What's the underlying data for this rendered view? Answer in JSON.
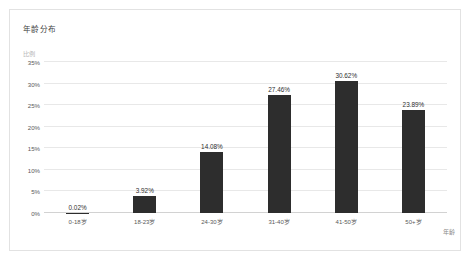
{
  "card": {
    "title": "年龄分布",
    "y_axis_title": "比例",
    "x_axis_title": "年龄"
  },
  "chart_data": {
    "type": "bar",
    "title": "年龄分布",
    "xlabel": "年龄",
    "ylabel": "比例",
    "categories": [
      "0-18岁",
      "18-23岁",
      "24-30岁",
      "31-40岁",
      "41-50岁",
      "50+岁"
    ],
    "values": [
      0.02,
      3.92,
      14.08,
      27.46,
      30.62,
      23.89
    ],
    "value_labels": [
      "0.02%",
      "3.92%",
      "14.08%",
      "27.46%",
      "30.62%",
      "23.89%"
    ],
    "ylim": [
      0,
      35
    ],
    "ytick_values": [
      0,
      5,
      10,
      15,
      20,
      25,
      30,
      35
    ],
    "ytick_labels": [
      "0%",
      "5%",
      "10%",
      "15%",
      "20%",
      "25%",
      "30%",
      "35%"
    ],
    "grid": "horizontal",
    "legend": "none",
    "bar_color": "#2d2d2d",
    "gridline_color": "#e8e8e8",
    "axis_color": "#d2d2d2",
    "background": "#ffffff"
  }
}
